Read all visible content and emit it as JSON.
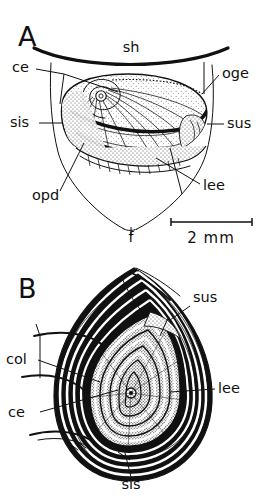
{
  "figure": {
    "background_color": "#ffffff",
    "ink_color": "#111111",
    "style": "black-and-white stippled scientific illustration"
  },
  "panels": [
    {
      "id": "A",
      "letter": "A",
      "view": "external ventral view of shell and foot",
      "labels": [
        {
          "key": "sh",
          "text": "sh",
          "meaning": "shell",
          "x": 131,
          "y": 52,
          "anchor": "middle"
        },
        {
          "key": "ce",
          "text": "ce",
          "meaning": "cephalic region",
          "x": 12,
          "y": 72,
          "anchor": "start"
        },
        {
          "key": "oge",
          "text": "oge",
          "meaning": "opercular groove edge",
          "x": 222,
          "y": 78,
          "anchor": "start"
        },
        {
          "key": "sis",
          "text": "sis",
          "meaning": "sinistral side",
          "x": 10,
          "y": 127,
          "anchor": "start"
        },
        {
          "key": "sus",
          "text": "sus",
          "meaning": "sutural side",
          "x": 227,
          "y": 128,
          "anchor": "start"
        },
        {
          "key": "opd",
          "text": "opd",
          "meaning": "opercular disc",
          "x": 32,
          "y": 200,
          "anchor": "start"
        },
        {
          "key": "lee",
          "text": "lee",
          "meaning": "leading edge",
          "x": 203,
          "y": 190,
          "anchor": "start"
        },
        {
          "key": "f",
          "text": "f",
          "meaning": "foot",
          "x": 131,
          "y": 242,
          "anchor": "middle"
        }
      ]
    },
    {
      "id": "B",
      "letter": "B",
      "view": "apical view of coiled shell",
      "labels": [
        {
          "key": "sus",
          "text": "sus",
          "meaning": "sutural side",
          "x": 193,
          "y": 302,
          "anchor": "start"
        },
        {
          "key": "col",
          "text": "col",
          "meaning": "columella",
          "x": 6,
          "y": 364,
          "anchor": "start"
        },
        {
          "key": "lee",
          "text": "lee",
          "meaning": "leading edge",
          "x": 218,
          "y": 393,
          "anchor": "start"
        },
        {
          "key": "ce",
          "text": "ce",
          "meaning": "cephalic region",
          "x": 8,
          "y": 417,
          "anchor": "start"
        },
        {
          "key": "sis",
          "text": "sis",
          "meaning": "sinistral side",
          "x": 131,
          "y": 489,
          "anchor": "middle"
        }
      ]
    }
  ],
  "scale_bar": {
    "label": "2 mm",
    "value": 2,
    "unit": "mm",
    "x_start": 171,
    "x_end": 252,
    "y": 222,
    "text_x": 211,
    "text_y": 243
  },
  "abbreviations": [
    {
      "key": "sh",
      "meaning": "shell"
    },
    {
      "key": "ce",
      "meaning": "cephalic region"
    },
    {
      "key": "oge",
      "meaning": "opercular groove edge"
    },
    {
      "key": "sis",
      "meaning": "sinistral side"
    },
    {
      "key": "sus",
      "meaning": "sutural side"
    },
    {
      "key": "opd",
      "meaning": "opercular disc"
    },
    {
      "key": "lee",
      "meaning": "leading edge"
    },
    {
      "key": "f",
      "meaning": "foot"
    },
    {
      "key": "col",
      "meaning": "columella"
    }
  ]
}
